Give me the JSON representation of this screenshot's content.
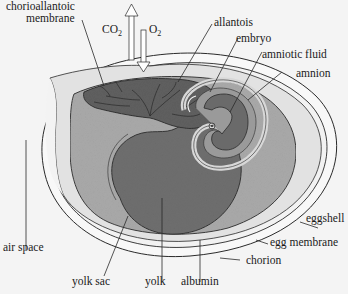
{
  "diagram": {
    "gas_exchange": {
      "out_label": "CO",
      "out_sub": "2",
      "in_label": "O",
      "in_sub": "2"
    },
    "labels": {
      "chorioallantoic_line1": "chorioallantoic",
      "chorioallantoic_line2": "membrane",
      "allantois": "allantois",
      "embryo": "embryo",
      "amniotic_fluid": "amniotic fluid",
      "amnion": "amnion",
      "eggshell": "eggshell",
      "egg_membrane": "egg membrane",
      "chorion": "chorion",
      "albumin": "albumin",
      "yolk": "yolk",
      "yolk_sac": "yolk sac",
      "air_space": "air space"
    },
    "colors": {
      "background": "#f4f4f4",
      "shell": "#f7f7f7",
      "albumin": "#dcdcdc",
      "chorion_cavity": "#a9a9a9",
      "yolk": "#6e6e6e",
      "allantois": "#5f5f5f",
      "amnion_light": "#c8c8c8",
      "outline": "#2a2a2a"
    }
  }
}
